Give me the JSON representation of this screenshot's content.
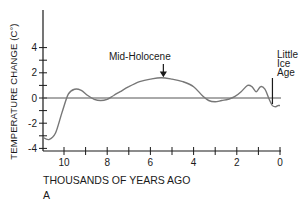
{
  "chart_data": {
    "type": "line",
    "title": "",
    "panel_label": "A",
    "xlabel": "THOUSANDS OF YEARS AGO",
    "ylabel": "TEMPERATURE CHANGE (C°)",
    "xlim": [
      11,
      0
    ],
    "ylim": [
      -4,
      6
    ],
    "x_ticks": [
      10,
      8,
      6,
      4,
      2,
      0
    ],
    "x_minor_ticks": [
      9,
      7,
      5,
      3,
      1
    ],
    "y_ticks": [
      4,
      2,
      0,
      -2,
      -4
    ],
    "y_minor_ticks": [
      3,
      1,
      -1,
      -3
    ],
    "grid": false,
    "reference_line": 0,
    "series": [
      {
        "name": "Temperature change",
        "x": [
          11.0,
          10.7,
          10.4,
          10.1,
          9.8,
          9.5,
          9.2,
          8.9,
          8.6,
          8.3,
          8.0,
          7.7,
          7.4,
          7.0,
          6.5,
          6.0,
          5.5,
          5.0,
          4.5,
          4.0,
          3.6,
          3.3,
          3.0,
          2.7,
          2.4,
          2.1,
          1.8,
          1.5,
          1.3,
          1.1,
          0.9,
          0.7,
          0.5,
          0.35,
          0.2,
          0.1,
          0.0
        ],
        "values": [
          -3.1,
          -3.3,
          -2.8,
          -1.2,
          0.3,
          0.7,
          0.6,
          0.2,
          -0.1,
          -0.2,
          -0.1,
          0.2,
          0.5,
          0.9,
          1.3,
          1.5,
          1.6,
          1.5,
          1.3,
          0.9,
          0.2,
          -0.2,
          -0.3,
          -0.2,
          -0.1,
          0.1,
          0.5,
          1.0,
          0.9,
          0.5,
          0.9,
          0.7,
          -0.1,
          -0.6,
          -0.7,
          -0.6,
          -0.6
        ]
      }
    ],
    "annotations": [
      {
        "text": "Mid-Holocene",
        "x": 5.4,
        "y": 1.6,
        "arrow": "down"
      },
      {
        "text": "Little Ice Age",
        "lines": [
          "Little",
          "Ice",
          "Age"
        ],
        "x": 0.35,
        "y": -0.6,
        "arrow": "down"
      }
    ]
  },
  "labels": {
    "ylabel": "TEMPERATURE CHANGE (C°)",
    "xlabel": "THOUSANDS OF YEARS AGO",
    "panel": "A",
    "ann_mid": "Mid-Holocene",
    "ann_lia_1": "Little",
    "ann_lia_2": "Ice",
    "ann_lia_3": "Age"
  }
}
